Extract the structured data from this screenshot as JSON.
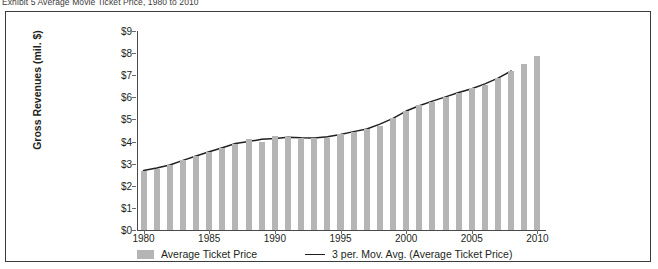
{
  "exhibit": {
    "title": "Exhibit 5  Average Movie Ticket Price, 1980 to 2010"
  },
  "axes": {
    "ylabel": "Gross Revenues (mil. $)",
    "yticks": [
      "$9",
      "$8",
      "$7",
      "$6",
      "$5",
      "$4",
      "$3",
      "$2",
      "$1",
      "$0"
    ],
    "xticks": [
      "1980",
      "1985",
      "1990",
      "1995",
      "2000",
      "2005",
      "2010"
    ]
  },
  "legend": {
    "bars_label": "Average Ticket Price",
    "line_label": "3 per. Mov. Avg. (Average Ticket Price)"
  },
  "colors": {
    "bar": "#b5b5b5",
    "line": "#231f20",
    "frame": "#3c3c3c",
    "background": "#ffffff"
  },
  "chart_data": {
    "type": "bar",
    "title": "Exhibit 5  Average Movie Ticket Price, 1980 to 2010",
    "xlabel": "",
    "ylabel": "Gross Revenues (mil. $)",
    "ylim": [
      0,
      9
    ],
    "ytick_step": 1,
    "grid": false,
    "legend_position": "bottom",
    "categories": [
      1980,
      1981,
      1982,
      1983,
      1984,
      1985,
      1986,
      1987,
      1988,
      1989,
      1990,
      1991,
      1992,
      1993,
      1994,
      1995,
      1996,
      1997,
      1998,
      1999,
      2000,
      2001,
      2002,
      2003,
      2004,
      2005,
      2006,
      2007,
      2008,
      2009,
      2010
    ],
    "series": [
      {
        "name": "Average Ticket Price",
        "type": "bar",
        "values": [
          2.69,
          2.78,
          2.94,
          3.15,
          3.36,
          3.55,
          3.71,
          3.91,
          4.11,
          3.97,
          4.23,
          4.21,
          4.15,
          4.14,
          4.18,
          4.35,
          4.42,
          4.59,
          4.69,
          5.08,
          5.39,
          5.66,
          5.81,
          6.03,
          6.21,
          6.41,
          6.55,
          6.88,
          7.18,
          7.5,
          7.89
        ]
      },
      {
        "name": "3 per. Mov. Avg. (Average Ticket Price)",
        "type": "line",
        "values": [
          2.69,
          2.8,
          2.94,
          3.15,
          3.35,
          3.54,
          3.72,
          3.91,
          4.0,
          4.1,
          4.14,
          4.2,
          4.17,
          4.16,
          4.22,
          4.32,
          4.45,
          4.57,
          4.79,
          5.05,
          5.38,
          5.62,
          5.83,
          6.02,
          6.22,
          6.39,
          6.61,
          6.87,
          7.19,
          null,
          null
        ]
      }
    ]
  }
}
